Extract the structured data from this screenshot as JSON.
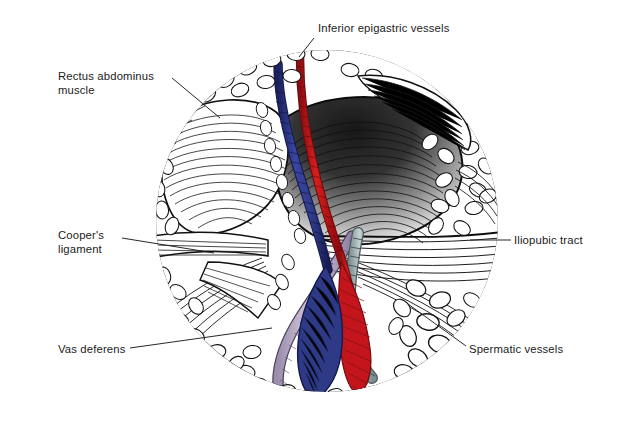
{
  "page": {
    "background_color": "#ffffff",
    "top_band_color": "#d8ecdf",
    "width": 628,
    "height": 423
  },
  "figure": {
    "kind": "anatomical-illustration",
    "style": "pen-and-ink line drawing with spot color",
    "frame_shape": "circle",
    "frame": {
      "cx": 327,
      "cy": 221,
      "r": 172,
      "stroke": "#111111",
      "stroke_width": 2.2
    },
    "colors": {
      "vein_blue": "#2f3a86",
      "vein_blue_dark": "#1b2260",
      "artery_red": "#c4161c",
      "artery_red_dark": "#8d0f13",
      "vas_lavender": "#c9bcd6",
      "vas_lavender_dark": "#8d7fa0",
      "cord_gray": "#9fb0b2",
      "ink": "#111111",
      "paper": "#ffffff"
    }
  },
  "labels": [
    {
      "id": "inferior-epigastric-vessels",
      "text": "Inferior epigastric vessels",
      "lines": [
        "Inferior epigastric vessels"
      ],
      "align": "left",
      "x": 318,
      "y": 22,
      "leader": {
        "x1": 314,
        "y1": 37,
        "x2": 299,
        "y2": 56
      }
    },
    {
      "id": "rectus-abdominus-muscle",
      "text": "Rectus abdominus muscle",
      "lines": [
        "Rectus abdominus",
        "muscle"
      ],
      "align": "left",
      "x": 58,
      "y": 70,
      "leader": {
        "x1": 172,
        "y1": 78,
        "x2": 218,
        "y2": 117
      }
    },
    {
      "id": "coopers-ligament",
      "text": "Cooper's ligament",
      "lines": [
        "Cooper's",
        "ligament"
      ],
      "align": "left",
      "x": 58,
      "y": 229,
      "leader": {
        "x1": 122,
        "y1": 238,
        "x2": 212,
        "y2": 253
      }
    },
    {
      "id": "vas-deferens",
      "text": "Vas deferens",
      "lines": [
        "Vas deferens"
      ],
      "align": "left",
      "x": 58,
      "y": 343,
      "leader": {
        "x1": 130,
        "y1": 348,
        "x2": 268,
        "y2": 329
      }
    },
    {
      "id": "iliopubic-tract",
      "text": "Iliopubic tract",
      "lines": [
        "Iliopubic tract"
      ],
      "align": "left",
      "x": 513,
      "y": 234,
      "leader": {
        "x1": 509,
        "y1": 240,
        "x2": 470,
        "y2": 240
      }
    },
    {
      "id": "spermatic-vessels",
      "text": "Spermatic vessels",
      "lines": [
        "Spermatic vessels"
      ],
      "align": "left",
      "x": 468,
      "y": 343,
      "leader": {
        "x1": 465,
        "y1": 347,
        "x2": 406,
        "y2": 305
      }
    }
  ],
  "structures": [
    {
      "id": "inferior-epigastric-vein",
      "color_role": "vein_blue",
      "description": "Long blue vein running superior-inferior through the centre of the field"
    },
    {
      "id": "inferior-epigastric-artery",
      "color_role": "artery_red",
      "description": "Red artery paralleling the blue vein, crossing to the lower right"
    },
    {
      "id": "vas-deferens-duct",
      "color_role": "vas_lavender",
      "description": "Pale lavender tube curving down and to the left"
    },
    {
      "id": "spermatic-vessel-bundle",
      "color_role": "cord_gray",
      "description": "Grey-green banded cord running to the lower right"
    },
    {
      "id": "rectus-abdominus",
      "color_role": "ink",
      "description": "Hatched muscle belly upper left"
    },
    {
      "id": "coopers-ligament-band",
      "color_role": "ink",
      "description": "Horizontal fibrous band, left of centre"
    },
    {
      "id": "iliopubic-tract-band",
      "color_role": "ink",
      "description": "Fibrous band sweeping to the right margin"
    },
    {
      "id": "peritoneal-fat",
      "color_role": "ink",
      "description": "Lobulated fat stippling filling the right and lower periphery"
    }
  ]
}
